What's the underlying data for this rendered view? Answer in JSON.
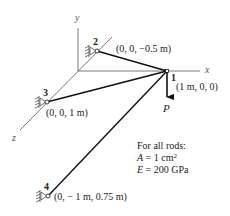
{
  "diagram": {
    "type": "3D truss / rod structure",
    "axes": {
      "x": "x",
      "y": "y",
      "z": "z"
    },
    "nodes": [
      {
        "id": "1",
        "label": "1",
        "coord": "(1 m, 0, 0)"
      },
      {
        "id": "2",
        "label": "2",
        "coord": "(0, 0, −0.5 m)"
      },
      {
        "id": "3",
        "label": "3",
        "coord": "(0, 0, 1 m)"
      },
      {
        "id": "4",
        "label": "4",
        "coord": "(0, − 1 m, 0.75 m)"
      }
    ],
    "members": [
      {
        "from": "2",
        "to": "1"
      },
      {
        "from": "3",
        "to": "1"
      },
      {
        "from": "4",
        "to": "1"
      }
    ],
    "supports": [
      "2",
      "3",
      "4"
    ],
    "load": {
      "node": "1",
      "label": "P",
      "direction": "down"
    },
    "properties": {
      "heading": "For all rods:",
      "area_symbol": "A",
      "area_value": "= 1 cm",
      "area_exp": "2",
      "modulus_symbol": "E",
      "modulus_value": "= 200 GPa"
    }
  }
}
